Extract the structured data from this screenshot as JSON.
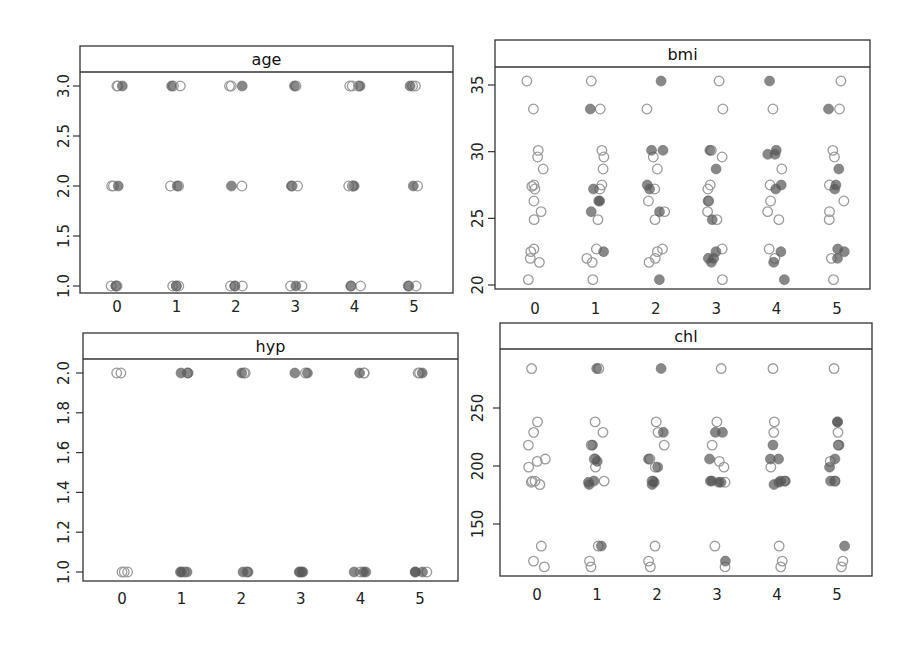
{
  "chart_data": [
    {
      "type": "scatter",
      "panel": "age",
      "title": "age",
      "xlabel": "",
      "ylabel": "",
      "x_ticks": [
        "0",
        "1",
        "2",
        "3",
        "4",
        "5"
      ],
      "y_ticks": [
        1.0,
        1.5,
        2.0,
        2.5,
        3.0
      ],
      "y_tick_labels": [
        "1.0",
        "1.5",
        "2.0",
        "2.5",
        "3.0"
      ],
      "ylim": [
        0.9,
        3.15
      ],
      "observed": {
        "0": [
          3,
          3,
          2,
          2,
          1,
          1,
          1
        ],
        "1": [
          3,
          3,
          2,
          2,
          1,
          1,
          1
        ],
        "2": [
          3,
          3,
          2,
          1,
          1,
          1
        ],
        "3": [
          3,
          2,
          2,
          1,
          1
        ],
        "4": [
          3,
          3,
          3,
          2,
          2,
          2,
          1,
          1
        ],
        "5": [
          3,
          3,
          2,
          1,
          1
        ]
      },
      "imputed": {
        "0": [
          3,
          2,
          1
        ],
        "1": [
          3,
          2,
          1
        ],
        "2": [
          3,
          2,
          1
        ],
        "3": [
          3,
          2,
          1
        ],
        "4": [
          3,
          2,
          1
        ],
        "5": [
          3,
          2,
          1
        ]
      }
    },
    {
      "type": "scatter",
      "panel": "bmi",
      "title": "bmi",
      "xlabel": "",
      "ylabel": "",
      "x_ticks": [
        "0",
        "1",
        "2",
        "3",
        "4",
        "5"
      ],
      "y_ticks": [
        20,
        25,
        30,
        35
      ],
      "y_tick_labels": [
        "20",
        "25",
        "30",
        "35"
      ],
      "ylim": [
        19.6,
        36.8
      ],
      "observed": {
        "0": [
          35.3,
          33.2,
          30.1,
          29.6,
          28.7,
          27.4,
          27.5,
          27.2,
          26.3,
          25.5,
          24.9,
          22.7,
          22.5,
          22.0,
          21.7,
          20.4
        ],
        "1": [
          35.3,
          33.2,
          30.1,
          29.6,
          28.7,
          27.5,
          27.2,
          24.9,
          22.7,
          22.0,
          21.7,
          20.4
        ],
        "2": [
          33.2,
          29.6,
          28.7,
          27.2,
          26.3,
          25.5,
          24.9,
          22.7,
          22.5,
          22.0,
          21.7
        ],
        "3": [
          35.3,
          33.2,
          30.1,
          29.6,
          27.5,
          27.2,
          26.3,
          25.5,
          24.9,
          22.7,
          20.4
        ],
        "4": [
          33.2,
          28.7,
          27.5,
          26.3,
          25.5,
          24.9,
          22.7,
          22.0
        ],
        "5": [
          35.3,
          33.2,
          30.1,
          29.6,
          27.5,
          26.3,
          25.5,
          24.9,
          22.0,
          20.4
        ]
      },
      "imputed": {
        "0": [],
        "1": [
          33.2,
          27.2,
          26.3,
          26.3,
          25.5,
          22.5
        ],
        "2": [
          35.3,
          30.1,
          30.1,
          27.5,
          27.2,
          25.5,
          20.4
        ],
        "3": [
          30.1,
          28.7,
          26.3,
          24.9,
          22.5,
          22.0,
          22.0,
          21.7
        ],
        "4": [
          35.3,
          30.1,
          29.8,
          29.8,
          27.5,
          27.2,
          22.5,
          21.7,
          20.4
        ],
        "5": [
          33.2,
          28.7,
          27.5,
          27.2,
          22.7,
          22.5,
          22.0
        ]
      }
    },
    {
      "type": "scatter",
      "panel": "hyp",
      "title": "hyp",
      "xlabel": "",
      "ylabel": "",
      "x_ticks": [
        "0",
        "1",
        "2",
        "3",
        "4",
        "5"
      ],
      "y_ticks": [
        1.0,
        1.2,
        1.4,
        1.6,
        1.8,
        2.0
      ],
      "y_tick_labels": [
        "1.0",
        "1.2",
        "1.4",
        "1.6",
        "1.8",
        "2.0"
      ],
      "ylim": [
        0.94,
        2.07
      ],
      "observed": {
        "0": [
          2,
          2,
          1,
          1,
          1
        ],
        "1": [
          2,
          1
        ],
        "2": [
          2,
          2,
          1
        ],
        "3": [
          2,
          1
        ],
        "4": [
          2,
          2,
          1
        ],
        "5": [
          2,
          2,
          1
        ]
      },
      "imputed": {
        "0": [],
        "1": [
          2,
          2,
          1,
          1,
          1
        ],
        "2": [
          2,
          1,
          1
        ],
        "3": [
          2,
          2,
          1,
          1,
          1
        ],
        "4": [
          2,
          1,
          1,
          1
        ],
        "5": [
          2,
          1,
          1,
          1
        ]
      }
    },
    {
      "type": "scatter",
      "panel": "chl",
      "title": "chl",
      "xlabel": "",
      "ylabel": "",
      "x_ticks": [
        "0",
        "1",
        "2",
        "3",
        "4",
        "5"
      ],
      "y_ticks": [
        150,
        200,
        250
      ],
      "y_tick_labels": [
        "150",
        "200",
        "250"
      ],
      "ylim": [
        100,
        297
      ],
      "observed": {
        "0": [
          284,
          238,
          229,
          218,
          206,
          204,
          199,
          187,
          186,
          184,
          187,
          131,
          118,
          113
        ],
        "1": [
          284,
          238,
          229,
          218,
          206,
          199,
          187,
          131,
          118,
          113
        ],
        "2": [
          238,
          229,
          218,
          206,
          199,
          187,
          131,
          118,
          113
        ],
        "3": [
          284,
          238,
          218,
          204,
          199,
          186,
          131,
          113
        ],
        "4": [
          284,
          238,
          229,
          199,
          187,
          131,
          118,
          113
        ],
        "5": [
          284,
          229,
          218,
          204,
          187,
          118,
          113
        ]
      },
      "imputed": {
        "0": [],
        "1": [
          284,
          218,
          206,
          204,
          187,
          186,
          184,
          131
        ],
        "2": [
          284,
          229,
          206,
          199,
          187,
          186,
          184
        ],
        "3": [
          229,
          229,
          206,
          187,
          187,
          186,
          186,
          118
        ],
        "4": [
          218,
          206,
          206,
          187,
          187,
          186,
          184
        ],
        "5": [
          238,
          238,
          218,
          206,
          199,
          187,
          187,
          131
        ]
      }
    }
  ],
  "colors": {
    "observed_stroke": "#9a9a9a",
    "imputed_fill": "#555555",
    "frame": "#333333"
  }
}
